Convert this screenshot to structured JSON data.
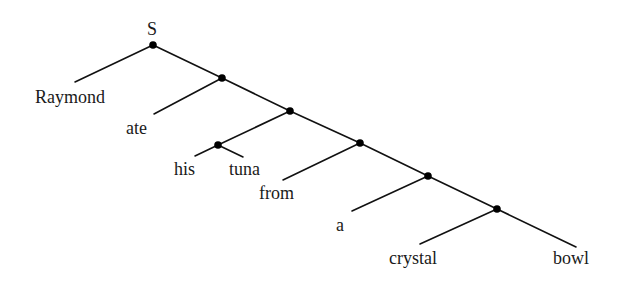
{
  "diagram": {
    "type": "syntax-tree",
    "root_label": "S",
    "words": [
      "Raymond",
      "ate",
      "his",
      "tuna",
      "from",
      "a",
      "crystal",
      "bowl"
    ],
    "colors": {
      "line": "#111111",
      "node": "#000000",
      "text": "#1a1a1a",
      "background": "#ffffff"
    }
  },
  "labels": {
    "root": "S",
    "raymond": "Raymond",
    "ate": "ate",
    "his": "his",
    "tuna": "tuna",
    "from": "from",
    "a": "a",
    "crystal": "crystal",
    "bowl": "bowl"
  }
}
